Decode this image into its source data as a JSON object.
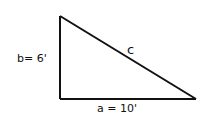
{
  "diagram": {
    "type": "right-triangle",
    "labels": {
      "b": "b= 6'",
      "c": "c",
      "a": "a = 10'"
    },
    "vertices": {
      "top_left": [
        60,
        16
      ],
      "bottom_left": [
        60,
        99
      ],
      "bottom_right": [
        196,
        99
      ]
    },
    "stroke_color": "#111111"
  }
}
